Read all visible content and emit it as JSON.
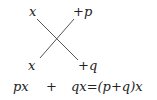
{
  "diagram": {
    "type": "cross-multiplication",
    "top_left": "x",
    "top_right": "+p",
    "bottom_left": "x",
    "bottom_right": "+q",
    "equation": {
      "term1": "px",
      "plus": "+",
      "term2": "qx=(p+q)x"
    },
    "line_color": "#555555"
  }
}
